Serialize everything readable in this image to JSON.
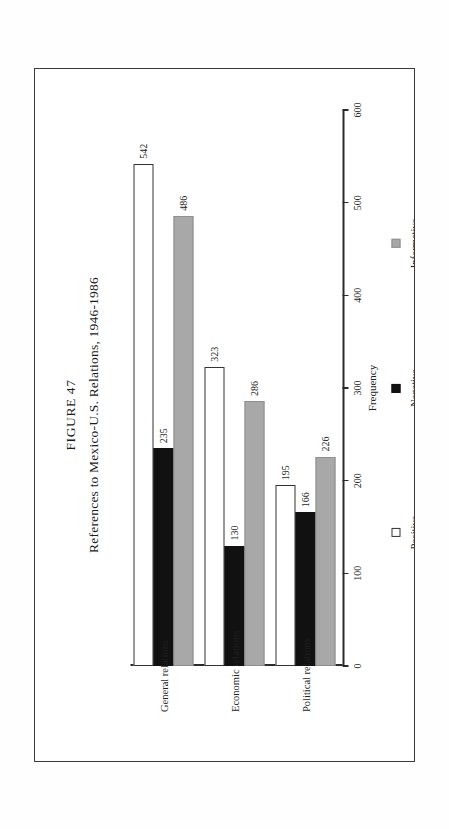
{
  "figure": {
    "number_label": "FIGURE 47",
    "caption": "References to Mexico-U.S. Relations, 1946-1986",
    "orientation": "landscape-rotated-90ccw"
  },
  "chart_data": {
    "type": "bar",
    "title": "References to Mexico-U.S. Relations, 1946-1986",
    "subtitle": "FIGURE 47",
    "orientation": "vertical",
    "xlabel": "",
    "ylabel": "Frequency",
    "ylim": [
      0,
      600
    ],
    "yticks": [
      0,
      100,
      200,
      300,
      400,
      500,
      600
    ],
    "ytick_labels": [
      "0",
      "100",
      "200",
      "300",
      "400",
      "500",
      "600"
    ],
    "grid": false,
    "legend_position": "bottom",
    "categories": [
      "General relations",
      "Economic relations",
      "Political relations"
    ],
    "series": [
      {
        "name": "Positive",
        "color": "#ffffff",
        "values": [
          542,
          323,
          195
        ]
      },
      {
        "name": "Negative",
        "color": "#111111",
        "values": [
          235,
          130,
          166
        ]
      },
      {
        "name": "Informative",
        "color": "#a8a8a8",
        "values": [
          486,
          286,
          226
        ]
      }
    ],
    "data_labels": [
      [
        "542",
        "235",
        "486"
      ],
      [
        "323",
        "130",
        "286"
      ],
      [
        "195",
        "166",
        "226"
      ]
    ]
  }
}
